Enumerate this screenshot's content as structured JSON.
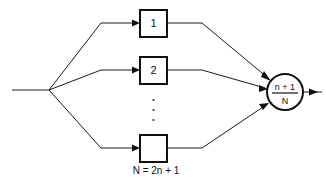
{
  "diagram": {
    "background_color": "#ffffff",
    "line_color": "#1a1a1a",
    "shape_stroke_color": "#111111",
    "input": {
      "name": "input-line",
      "label": ""
    },
    "branches": [
      {
        "id": "branch-1",
        "box_label": "1",
        "box": {
          "x": 140,
          "y": 10,
          "w": 27,
          "h": 27
        }
      },
      {
        "id": "branch-2",
        "box_label": "2",
        "box": {
          "x": 140,
          "y": 57,
          "w": 27,
          "h": 27
        }
      },
      {
        "id": "branch-n",
        "box_label": "",
        "box": {
          "x": 140,
          "y": 135,
          "w": 27,
          "h": 27
        }
      }
    ],
    "ellipsis": {
      "name": "vertical-ellipsis",
      "dots": 3
    },
    "voter": {
      "name": "majority-voter",
      "numerator": "n + 1",
      "denominator": "N",
      "center": {
        "x": 285,
        "y": 92
      },
      "radius": 18
    },
    "caption": "N = 2n + 1",
    "output": {
      "name": "output-line",
      "label": ""
    }
  }
}
